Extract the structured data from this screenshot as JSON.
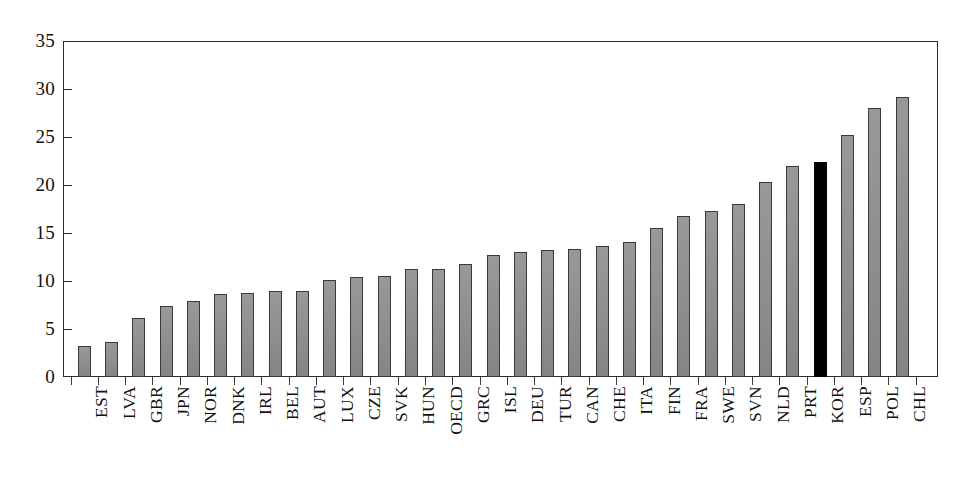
{
  "chart_data": {
    "type": "bar",
    "title": "",
    "subtitle": "",
    "xlabel": "",
    "ylabel": "",
    "ylim": [
      0,
      35
    ],
    "yticks": [
      0,
      5,
      10,
      15,
      20,
      25,
      30,
      35
    ],
    "ytick_labels": [
      "0",
      "5",
      "10",
      "15",
      "20",
      "25",
      "30",
      "35"
    ],
    "grid": false,
    "legend": "none",
    "bar_color": "#8d8d8d",
    "highlight_color": "#000000",
    "highlight_category": "KOR",
    "categories": [
      "EST",
      "LVA",
      "GBR",
      "JPN",
      "NOR",
      "DNK",
      "IRL",
      "BEL",
      "AUT",
      "LUX",
      "CZE",
      "SVK",
      "HUN",
      "OECD",
      "GRC",
      "ISL",
      "DEU",
      "TUR",
      "CAN",
      "CHE",
      "ITA",
      "FIN",
      "FRA",
      "SWE",
      "SVN",
      "NLD",
      "PRT",
      "KOR",
      "ESP",
      "POL",
      "CHL"
    ],
    "values": [
      3.2,
      3.6,
      6.1,
      7.4,
      7.9,
      8.6,
      8.7,
      9.0,
      9.0,
      10.1,
      10.4,
      10.5,
      11.2,
      11.3,
      11.8,
      12.7,
      13.0,
      13.2,
      13.3,
      13.6,
      14.1,
      15.5,
      16.8,
      17.3,
      18.0,
      20.3,
      22.0,
      22.4,
      25.2,
      28.0,
      29.2
    ]
  }
}
